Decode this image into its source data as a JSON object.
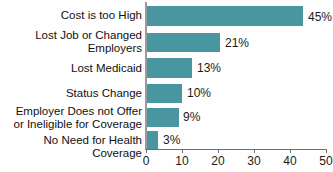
{
  "chart_data": {
    "type": "bar",
    "orientation": "horizontal",
    "title": "",
    "subtitle": "",
    "xlabel": "",
    "ylabel": "",
    "xlim": [
      0,
      50
    ],
    "grid": false,
    "legend": false,
    "bar_color": "#4a96a0",
    "axis_color": "#6f6f6f",
    "baseline_color": "#9a9a9a",
    "text_color": "#111111",
    "background": "#ffffff",
    "categories": [
      "Cost is too High",
      "Lost Job or Changed\nEmployers",
      "Lost Medicaid",
      "Status Change",
      "Employer Does not Offer\nor Ineligible for Coverage",
      "No Need for Health Coverage"
    ],
    "values": [
      45,
      21,
      13,
      10,
      9,
      3
    ],
    "value_labels": [
      "45%",
      "21%",
      "13%",
      "10%",
      "9%",
      "3%"
    ],
    "xticks": [
      0,
      10,
      20,
      30,
      40,
      50
    ],
    "xtick_labels": [
      "0",
      "10",
      "20",
      "30",
      "40",
      "50"
    ]
  },
  "rows": [
    {
      "label": "Cost is too High",
      "value": 45,
      "value_label": "45%",
      "top": 6,
      "height": 20,
      "bar_width": 156,
      "label_top": 9,
      "val_left": 308,
      "val_top": 10
    },
    {
      "label": "Lost Job or Changed\nEmployers",
      "value": 21,
      "value_label": "21%",
      "top": 33,
      "height": 19,
      "bar_width": 73,
      "label_top": 29,
      "val_left": 225,
      "val_top": 36
    },
    {
      "label": "Lost Medicaid",
      "value": 13,
      "value_label": "13%",
      "top": 58,
      "height": 20,
      "bar_width": 45,
      "label_top": 62,
      "val_left": 197,
      "val_top": 61
    },
    {
      "label": "Status Change",
      "value": 10,
      "value_label": "10%",
      "top": 84,
      "height": 19,
      "bar_width": 35,
      "label_top": 87,
      "val_left": 187,
      "val_top": 86
    },
    {
      "label": "Employer Does not Offer\nor Ineligible for Coverage",
      "value": 9,
      "value_label": "9%",
      "top": 108,
      "height": 19,
      "bar_width": 32,
      "label_top": 105,
      "val_left": 183,
      "val_top": 110
    },
    {
      "label": "No Need for Health Coverage",
      "value": 3,
      "value_label": "3%",
      "top": 131,
      "height": 18,
      "bar_width": 11,
      "label_top": 134,
      "val_left": 163,
      "val_top": 133
    }
  ],
  "xaxis": {
    "ticks": [
      {
        "label": "0",
        "x": 146
      },
      {
        "label": "10",
        "x": 182
      },
      {
        "label": "20",
        "x": 218
      },
      {
        "label": "30",
        "x": 254
      },
      {
        "label": "40",
        "x": 290
      },
      {
        "label": "50",
        "x": 326
      }
    ]
  }
}
